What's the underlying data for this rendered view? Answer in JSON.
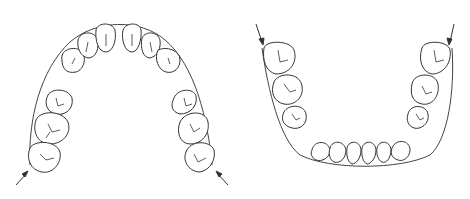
{
  "figure": {
    "panels": [
      {
        "id": "upper-arch",
        "label": "Maxillary arch with archwire",
        "arrows": 2
      },
      {
        "id": "lower-arch",
        "label": "Mandibular arch with archwire",
        "arrows": 2
      }
    ]
  }
}
